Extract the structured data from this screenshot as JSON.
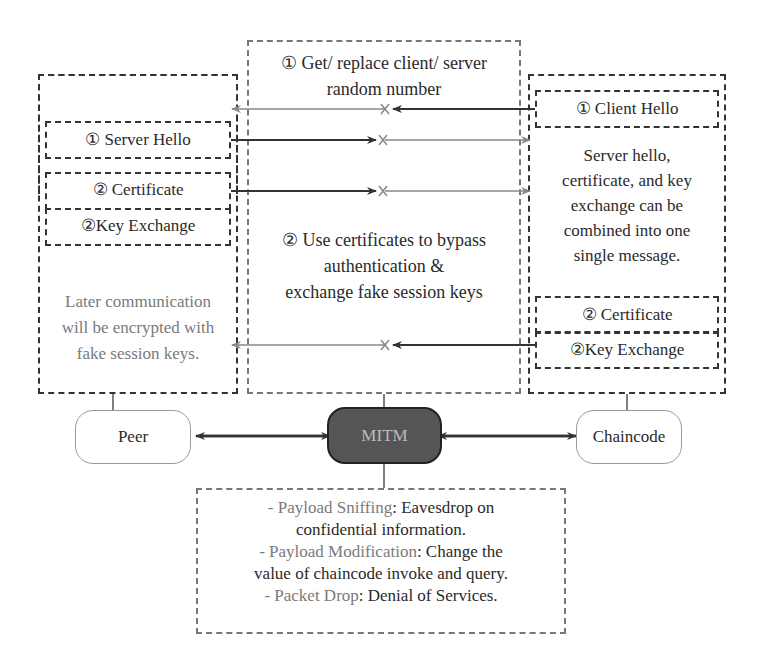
{
  "diagram": {
    "left_panel": {
      "server_hello": "① Server Hello",
      "certificate": "② Certificate",
      "key_exchange": "②Key Exchange",
      "note_lines": [
        "Later communication",
        "will be encrypted with",
        "fake session keys."
      ]
    },
    "middle_panel": {
      "step1_lines": [
        "① Get/ replace client/ server",
        "random number"
      ],
      "step2_lines": [
        "② Use certificates to bypass",
        "authentication &",
        "exchange fake session keys"
      ]
    },
    "right_panel": {
      "client_hello": "① Client Hello",
      "note_lines": [
        "Server hello,",
        "certificate, and key",
        "exchange can be",
        "combined into one",
        "single message."
      ],
      "certificate": "② Certificate",
      "key_exchange": "②Key Exchange"
    },
    "nodes": {
      "peer": "Peer",
      "mitm": "MITM",
      "chaincode": "Chaincode"
    },
    "attacks": [
      {
        "name": "- Payload Sniffing",
        "desc": ": Eavesdrop on",
        "cont": "confidential information."
      },
      {
        "name": "- Payload Modification",
        "desc": ": Change the",
        "cont": "value of chaincode invoke and query."
      },
      {
        "name": "- Packet Drop",
        "desc": ": Denial of Services.",
        "cont": ""
      }
    ],
    "colors": {
      "mitm_fill": "#555555",
      "primary_line": "#333333",
      "secondary_line": "#808080",
      "attack_name": "#7a7a7a"
    }
  }
}
